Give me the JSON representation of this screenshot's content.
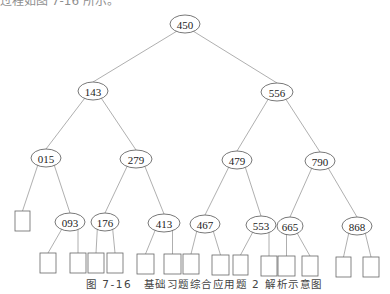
{
  "top_text": "过程如图 7-16 所示。",
  "caption": "图 7-16　基础习题综合应用题 2 解析示意图",
  "tree": {
    "nodes": [
      {
        "id": "n450",
        "label": "450",
        "x": 185,
        "y": 24,
        "rx": 15,
        "ry": 9
      },
      {
        "id": "n143",
        "label": "143",
        "x": 93,
        "y": 91,
        "rx": 15,
        "ry": 9
      },
      {
        "id": "n556",
        "label": "556",
        "x": 277,
        "y": 92,
        "rx": 16,
        "ry": 9
      },
      {
        "id": "n015",
        "label": "015",
        "x": 46,
        "y": 158,
        "rx": 15,
        "ry": 9
      },
      {
        "id": "n279",
        "label": "279",
        "x": 136,
        "y": 159,
        "rx": 16,
        "ry": 9
      },
      {
        "id": "n479",
        "label": "479",
        "x": 237,
        "y": 160,
        "rx": 15,
        "ry": 9
      },
      {
        "id": "n790",
        "label": "790",
        "x": 320,
        "y": 161,
        "rx": 15,
        "ry": 9
      },
      {
        "id": "n093",
        "label": "093",
        "x": 70,
        "y": 222,
        "rx": 15,
        "ry": 9
      },
      {
        "id": "n176",
        "label": "176",
        "x": 105,
        "y": 222,
        "rx": 14,
        "ry": 9
      },
      {
        "id": "n413",
        "label": "413",
        "x": 164,
        "y": 223,
        "rx": 16,
        "ry": 9
      },
      {
        "id": "n467",
        "label": "467",
        "x": 205,
        "y": 224,
        "rx": 15,
        "ry": 9
      },
      {
        "id": "n553",
        "label": "553",
        "x": 261,
        "y": 225,
        "rx": 15,
        "ry": 9
      },
      {
        "id": "n665",
        "label": "665",
        "x": 290,
        "y": 226,
        "rx": 13,
        "ry": 9
      },
      {
        "id": "n868",
        "label": "868",
        "x": 357,
        "y": 226,
        "rx": 15,
        "ry": 9
      }
    ],
    "leaves": [
      {
        "id": "l0",
        "x": 15,
        "y": 211,
        "w": 15,
        "h": 20
      },
      {
        "id": "l1",
        "x": 40,
        "y": 253,
        "w": 16,
        "h": 20
      },
      {
        "id": "l2",
        "x": 70,
        "y": 253,
        "w": 16,
        "h": 20
      },
      {
        "id": "l3",
        "x": 88,
        "y": 253,
        "w": 16,
        "h": 20
      },
      {
        "id": "l4",
        "x": 107,
        "y": 253,
        "w": 16,
        "h": 20
      },
      {
        "id": "l5",
        "x": 137,
        "y": 254,
        "w": 17,
        "h": 20
      },
      {
        "id": "l6",
        "x": 164,
        "y": 254,
        "w": 17,
        "h": 20
      },
      {
        "id": "l7",
        "x": 183,
        "y": 254,
        "w": 16,
        "h": 20
      },
      {
        "id": "l8",
        "x": 212,
        "y": 255,
        "w": 17,
        "h": 20
      },
      {
        "id": "l9",
        "x": 233,
        "y": 255,
        "w": 15,
        "h": 20
      },
      {
        "id": "l10",
        "x": 261,
        "y": 256,
        "w": 16,
        "h": 20
      },
      {
        "id": "l11",
        "x": 278,
        "y": 256,
        "w": 17,
        "h": 20
      },
      {
        "id": "l12",
        "x": 302,
        "y": 256,
        "w": 16,
        "h": 20
      },
      {
        "id": "l13",
        "x": 336,
        "y": 257,
        "w": 15,
        "h": 20
      },
      {
        "id": "l14",
        "x": 363,
        "y": 257,
        "w": 16,
        "h": 20
      }
    ],
    "edges": [
      [
        "n450",
        "n143"
      ],
      [
        "n450",
        "n556"
      ],
      [
        "n143",
        "n015"
      ],
      [
        "n143",
        "n279"
      ],
      [
        "n556",
        "n479"
      ],
      [
        "n556",
        "n790"
      ],
      [
        "n015",
        "l0"
      ],
      [
        "n015",
        "n093"
      ],
      [
        "n279",
        "n176"
      ],
      [
        "n279",
        "n413"
      ],
      [
        "n479",
        "n467"
      ],
      [
        "n479",
        "n553"
      ],
      [
        "n790",
        "n665"
      ],
      [
        "n790",
        "n868"
      ],
      [
        "n093",
        "l1"
      ],
      [
        "n093",
        "l2"
      ],
      [
        "n176",
        "l3"
      ],
      [
        "n176",
        "l4"
      ],
      [
        "n413",
        "l5"
      ],
      [
        "n413",
        "l6"
      ],
      [
        "n467",
        "l7"
      ],
      [
        "n467",
        "l8"
      ],
      [
        "n553",
        "l9"
      ],
      [
        "n553",
        "l10"
      ],
      [
        "n665",
        "l11"
      ],
      [
        "n665",
        "l12"
      ],
      [
        "n868",
        "l13"
      ],
      [
        "n868",
        "l14"
      ]
    ]
  }
}
